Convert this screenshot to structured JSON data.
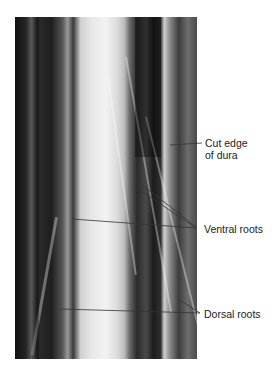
{
  "figure": {
    "image_alt": "Photograph of exposed spinal cord with cut dura and nerve roots",
    "labels": {
      "cut_edge_line1": "Cut edge",
      "cut_edge_line2": "of dura",
      "ventral_roots": "Ventral roots",
      "dorsal_roots": "Dorsal roots"
    },
    "colors": {
      "label_text": "#222222",
      "leader_line": "#333333",
      "background": "#ffffff"
    }
  }
}
